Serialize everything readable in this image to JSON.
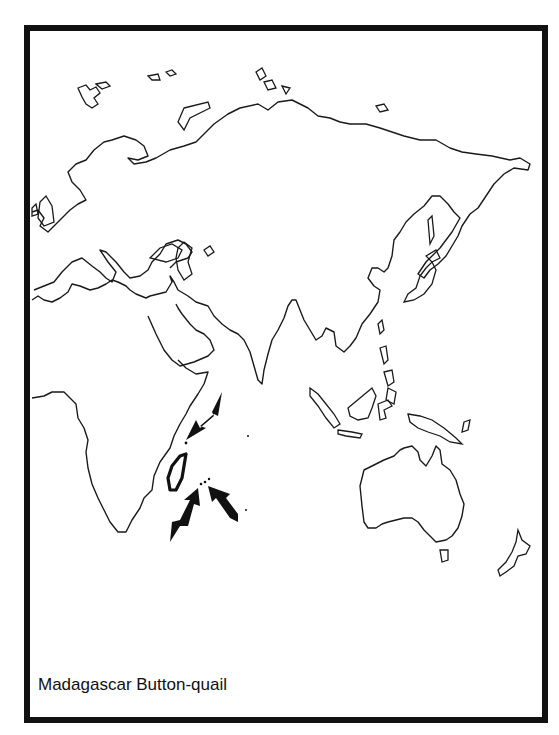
{
  "map": {
    "title": "Madagascar Button-quail",
    "region_shown": "Old World (Eurasia, Africa, Australasia)",
    "range_highlight": "Madagascar",
    "arrows": [
      {
        "name": "arrow-northeast",
        "points_to": "Comoros"
      },
      {
        "name": "arrow-southwest",
        "points_to": "Mascarene Islands"
      },
      {
        "name": "arrow-southeast",
        "points_to": "Mascarene Islands"
      }
    ],
    "colors": {
      "line": "#111111",
      "background": "#ffffff"
    }
  }
}
